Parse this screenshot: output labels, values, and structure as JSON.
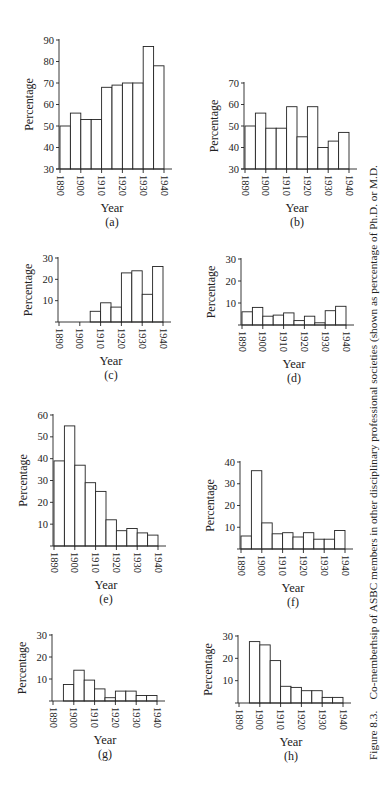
{
  "figure": {
    "caption_label": "Figure 8.3.",
    "caption_text": "Co-memberhsip of ASBC members in other disciplinary professional societies (shown as percentage of Ph.D. or M.D."
  },
  "chart_data": [
    {
      "id": "a",
      "type": "bar",
      "title": "",
      "panel_label": "(a)",
      "xlabel": "Year",
      "ylabel": "Percentage",
      "x_tick_labels": [
        "1890",
        "1900",
        "1910",
        "1920",
        "1930",
        "1940"
      ],
      "bins": [
        "1890-1895",
        "1895-1900",
        "1900-1905",
        "1905-1910",
        "1910-1915",
        "1915-1920",
        "1920-1925",
        "1925-1930",
        "1930-1935",
        "1935-1940"
      ],
      "values": [
        50,
        56,
        53,
        53,
        68,
        69,
        70,
        70,
        87,
        78
      ],
      "ylim": [
        30,
        90
      ],
      "yticks": [
        30,
        40,
        50,
        60,
        70,
        80,
        90
      ],
      "grid": false
    },
    {
      "id": "b",
      "type": "bar",
      "title": "",
      "panel_label": "(b)",
      "xlabel": "Year",
      "ylabel": "Percentage",
      "x_tick_labels": [
        "1890",
        "1900",
        "1910",
        "1920",
        "1930",
        "1940"
      ],
      "bins": [
        "1890-1895",
        "1895-1900",
        "1900-1905",
        "1905-1910",
        "1910-1915",
        "1915-1920",
        "1920-1925",
        "1925-1930",
        "1930-1935",
        "1935-1940"
      ],
      "values": [
        50,
        56,
        49,
        49,
        59,
        45,
        59,
        40,
        43,
        47
      ],
      "ylim": [
        30,
        70
      ],
      "yticks": [
        30,
        40,
        50,
        60,
        70
      ],
      "grid": false
    },
    {
      "id": "c",
      "type": "bar",
      "title": "",
      "panel_label": "(c)",
      "xlabel": "Year",
      "ylabel": "Percentage",
      "x_tick_labels": [
        "1890",
        "1900",
        "1910",
        "1920",
        "1930",
        "1940"
      ],
      "bins": [
        "1890-1895",
        "1895-1900",
        "1900-1905",
        "1905-1910",
        "1910-1915",
        "1915-1920",
        "1920-1925",
        "1925-1930",
        "1930-1935",
        "1935-1940"
      ],
      "values": [
        0,
        0,
        0,
        5,
        9,
        7,
        23,
        24,
        13,
        26
      ],
      "ylim": [
        0,
        30
      ],
      "yticks": [
        10,
        20,
        30
      ],
      "grid": false
    },
    {
      "id": "d",
      "type": "bar",
      "title": "",
      "panel_label": "(d)",
      "xlabel": "Year",
      "ylabel": "Percentage",
      "x_tick_labels": [
        "1890",
        "1900",
        "1910",
        "1920",
        "1930",
        "1940"
      ],
      "bins": [
        "1890-1895",
        "1895-1900",
        "1900-1905",
        "1905-1910",
        "1910-1915",
        "1915-1920",
        "1920-1925",
        "1925-1930",
        "1930-1935",
        "1935-1940"
      ],
      "values": [
        6,
        8,
        4,
        4.5,
        5.5,
        2,
        4,
        1,
        6.5,
        8.5
      ],
      "ylim": [
        0,
        30
      ],
      "yticks": [
        10,
        20,
        30
      ],
      "grid": false
    },
    {
      "id": "e",
      "type": "bar",
      "title": "",
      "panel_label": "(e)",
      "xlabel": "Year",
      "ylabel": "Percentage",
      "x_tick_labels": [
        "1890",
        "1900",
        "1910",
        "1920",
        "1930",
        "1940"
      ],
      "bins": [
        "1890-1895",
        "1895-1900",
        "1900-1905",
        "1905-1910",
        "1910-1915",
        "1915-1920",
        "1920-1925",
        "1925-1930",
        "1930-1935",
        "1935-1940"
      ],
      "values": [
        39,
        55,
        37,
        29,
        25,
        12,
        7,
        8,
        6,
        5
      ],
      "ylim": [
        0,
        60
      ],
      "yticks": [
        10,
        20,
        30,
        40,
        50,
        60
      ],
      "grid": false
    },
    {
      "id": "f",
      "type": "bar",
      "title": "",
      "panel_label": "(f)",
      "xlabel": "Year",
      "ylabel": "Percentage",
      "x_tick_labels": [
        "1890",
        "1900",
        "1910",
        "1920",
        "1930",
        "1940"
      ],
      "bins": [
        "1890-1895",
        "1895-1900",
        "1900-1905",
        "1905-1910",
        "1910-1915",
        "1915-1920",
        "1920-1925",
        "1925-1930",
        "1930-1935",
        "1935-1940"
      ],
      "values": [
        6,
        36,
        12,
        7,
        7.5,
        5.5,
        7.5,
        4.5,
        4.5,
        8.5
      ],
      "ylim": [
        0,
        40
      ],
      "yticks": [
        10,
        20,
        30,
        40
      ],
      "grid": false
    },
    {
      "id": "g",
      "type": "bar",
      "title": "",
      "panel_label": "(g)",
      "xlabel": "Year",
      "ylabel": "Percentage",
      "x_tick_labels": [
        "1890",
        "1900",
        "1910",
        "1920",
        "1930",
        "1940"
      ],
      "bins": [
        "1890-1895",
        "1895-1900",
        "1900-1905",
        "1905-1910",
        "1910-1915",
        "1915-1920",
        "1920-1925",
        "1925-1930",
        "1930-1935",
        "1935-1940"
      ],
      "values": [
        0,
        7.5,
        14,
        9.5,
        5.5,
        1.5,
        4.5,
        4.5,
        2.5,
        2.5
      ],
      "ylim": [
        0,
        30
      ],
      "yticks": [
        10,
        20,
        30
      ],
      "grid": false
    },
    {
      "id": "h",
      "type": "bar",
      "title": "",
      "panel_label": "(h)",
      "xlabel": "Year",
      "ylabel": "Percentage",
      "x_tick_labels": [
        "1890",
        "1900",
        "1910",
        "1920",
        "1930",
        "1940"
      ],
      "bins": [
        "1890-1895",
        "1895-1900",
        "1900-1905",
        "1905-1910",
        "1910-1915",
        "1915-1920",
        "1920-1925",
        "1925-1930",
        "1930-1935",
        "1935-1940"
      ],
      "values": [
        0,
        27.5,
        26,
        19,
        7.5,
        7,
        5.5,
        5.5,
        2.5,
        2.5
      ],
      "ylim": [
        0,
        30
      ],
      "yticks": [
        10,
        20,
        30
      ],
      "grid": false
    }
  ]
}
